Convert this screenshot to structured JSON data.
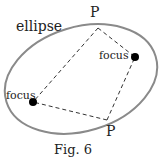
{
  "diagram": {
    "title": "ellipse",
    "caption": "Fig. 6",
    "points": {
      "p_top": {
        "label": "P",
        "x": 98,
        "y": 28
      },
      "p_bottom": {
        "label": "P",
        "x": 107,
        "y": 120
      }
    },
    "foci": {
      "right": {
        "label": "focus",
        "x": 135,
        "y": 57
      },
      "left": {
        "label": "focus",
        "x": 33,
        "y": 102
      }
    },
    "colors": {
      "ellipse_stroke": "#8a8a8a",
      "lines": "#333333",
      "focus_fill": "#000000"
    }
  }
}
